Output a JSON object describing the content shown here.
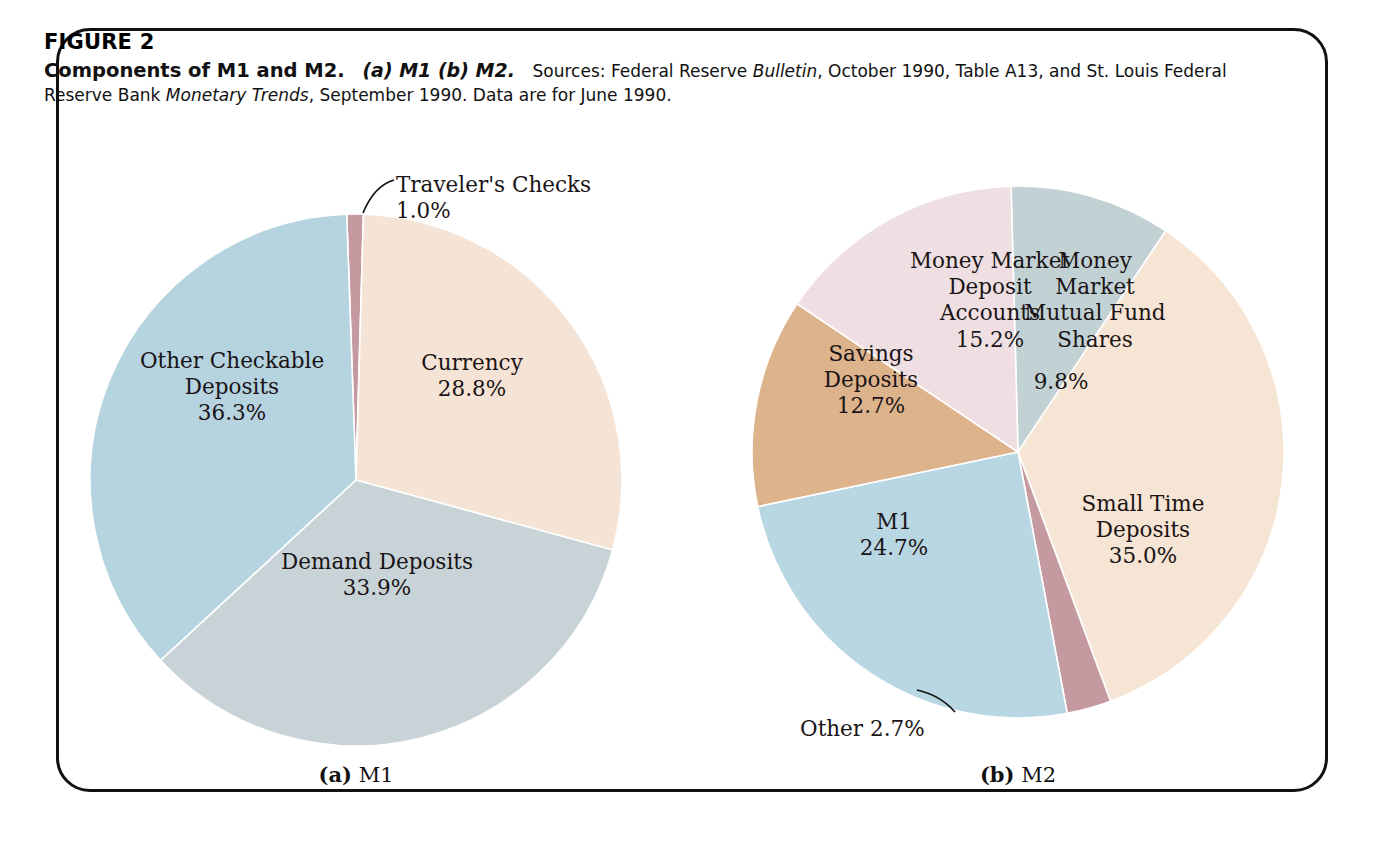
{
  "figure": {
    "number": "FIGURE 2",
    "title": "Components of M1 and M2.",
    "parts": "(a) M1 (b) M2.",
    "source_prefix": "Sources: Federal Reserve ",
    "source_italic_1": "Bulletin",
    "source_mid": ", October 1990, Table A13, and St. Louis Federal Reserve Bank ",
    "source_italic_2": "Monetary Trends",
    "source_suffix": ", September 1990. Data are for June 1990."
  },
  "subcaptions": {
    "a_marker": "(a)",
    "a_label": "M1",
    "b_marker": "(b)",
    "b_label": "M2"
  },
  "chart_data": [
    {
      "type": "pie",
      "title": "M1",
      "id": "m1",
      "center": [
        356,
        480
      ],
      "radius": 266,
      "start_angle": -2.0,
      "categories": [
        "Traveler's Checks",
        "Currency",
        "Demand Deposits",
        "Other Checkable Deposits"
      ],
      "values": [
        1.0,
        28.8,
        33.9,
        36.3
      ],
      "value_labels": [
        "1.0%",
        "28.8%",
        "33.9%",
        "36.3%"
      ],
      "colors": [
        "#c49aa0",
        "#f5e3d5",
        "#c8d3d8",
        "#b6d3e0"
      ],
      "labels": [
        {
          "name": "travelers-checks",
          "text": "Traveler's Checks\n1.0%",
          "placement": "callout",
          "x": 396,
          "y": 172,
          "align": "left",
          "leader": {
            "x1": 363,
            "y1": 213,
            "cx": 374,
            "cy": 186,
            "x2": 394,
            "y2": 180
          }
        },
        {
          "name": "currency",
          "text": "Currency\n28.8%",
          "placement": "inside",
          "x": 472,
          "y": 376
        },
        {
          "name": "demand-deposits",
          "text": "Demand Deposits\n33.9%",
          "placement": "inside",
          "x": 377,
          "y": 575
        },
        {
          "name": "other-checkable-deposits",
          "text": "Other Checkable\nDeposits\n36.3%",
          "placement": "inside",
          "x": 232,
          "y": 387
        }
      ]
    },
    {
      "type": "pie",
      "title": "M2",
      "id": "m2",
      "center": [
        1018,
        452
      ],
      "radius": 266,
      "start_angle": -1.5,
      "categories": [
        "Money Market Mutual Fund Shares",
        "Small Time Deposits",
        "Other",
        "M1",
        "Savings Deposits",
        "Money Market Deposit Accounts"
      ],
      "values": [
        9.8,
        35.0,
        2.7,
        24.7,
        12.7,
        15.2
      ],
      "value_labels": [
        "9.8%",
        "35.0%",
        "2.7%",
        "24.7%",
        "12.7%",
        "15.2%"
      ],
      "colors": [
        "#c2d1d4",
        "#f6e4d4",
        "#c49aa0",
        "#b9d6e3",
        "#ddb38c",
        "#efdfe2"
      ],
      "labels": [
        {
          "name": "money-market-mutual-fund-shares",
          "text": "Money\nMarket\nMutual Fund\nShares",
          "placement": "inside",
          "x": 1095,
          "y": 300
        },
        {
          "name": "money-market-mutual-fund-shares-value",
          "text": "9.8%",
          "placement": "inside",
          "x": 1061,
          "y": 382
        },
        {
          "name": "small-time-deposits",
          "text": "Small Time\nDeposits\n35.0%",
          "placement": "inside",
          "x": 1143,
          "y": 530
        },
        {
          "name": "m1-share",
          "text": "M1\n24.7%",
          "placement": "inside",
          "x": 894,
          "y": 535
        },
        {
          "name": "savings-deposits",
          "text": "Savings\nDeposits\n12.7%",
          "placement": "inside",
          "x": 871,
          "y": 380
        },
        {
          "name": "money-market-deposit-accounts",
          "text": "Money Market\nDeposit\nAccounts\n15.2%",
          "placement": "inside",
          "x": 990,
          "y": 300
        },
        {
          "name": "other",
          "text": "Other   2.7%",
          "placement": "callout",
          "x": 800,
          "y": 716,
          "align": "left",
          "leader": {
            "x1": 955,
            "y1": 712,
            "cx": 940,
            "cy": 695,
            "x2": 917,
            "y2": 690
          }
        }
      ]
    }
  ]
}
